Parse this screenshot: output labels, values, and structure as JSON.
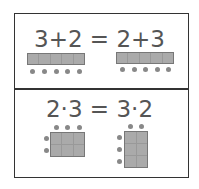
{
  "top_panel": {
    "equation": "3+2 = 2+3",
    "left_bar": {
      "cells": 5,
      "dots": 5
    },
    "right_bar": {
      "cells": 5,
      "dots": 5
    }
  },
  "bottom_panel": {
    "equation": "2·3 = 3·2",
    "left_grid": {
      "rows": 2,
      "cols": 3
    },
    "right_grid": {
      "rows": 3,
      "cols": 2
    }
  },
  "colors": {
    "border": "#333333",
    "text": "#555555",
    "cell": "#aaaaaa",
    "dot": "#888888"
  }
}
